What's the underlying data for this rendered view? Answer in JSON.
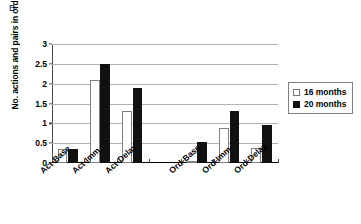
{
  "panel": {
    "label": "B"
  },
  "legend": {
    "position": "right",
    "entries": [
      {
        "label": "16 months",
        "swatch": "white-square-icon",
        "color": "#ffffff"
      },
      {
        "label": "20 months",
        "swatch": "black-square-icon",
        "color": "#111111"
      }
    ]
  },
  "chart_data": {
    "type": "bar",
    "title": "",
    "subtitle": "",
    "xlabel": "",
    "ylabel": "No. actions and pairs in order",
    "ylim": [
      0,
      3
    ],
    "yticks": [
      "0",
      "0.5",
      "1",
      "1.5",
      "2",
      "2.5",
      "3"
    ],
    "ytick_values": [
      0,
      0.5,
      1,
      1.5,
      2,
      2.5,
      3
    ],
    "grid": true,
    "legend_position": "right",
    "categories": [
      "Act-Base",
      "Act-Imm",
      "Act-Delay",
      "",
      "Ord-Base",
      "Ord-Imm",
      "Ord-Delay"
    ],
    "series": [
      {
        "name": "16 months",
        "values": [
          0.35,
          2.1,
          1.3,
          null,
          0.03,
          0.88,
          0.38
        ]
      },
      {
        "name": "20 months",
        "values": [
          0.35,
          2.5,
          1.9,
          null,
          0.52,
          1.3,
          0.95
        ]
      }
    ]
  }
}
